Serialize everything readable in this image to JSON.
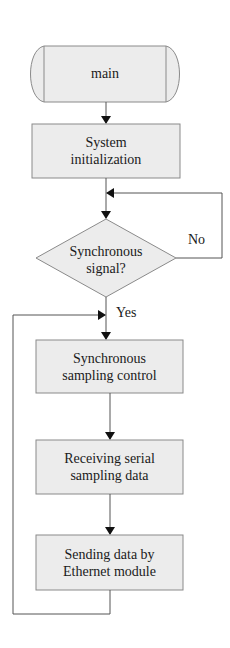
{
  "diagram": {
    "type": "flowchart",
    "colors": {
      "box_fill": "#ececec",
      "box_stroke": "#8a8a8a",
      "line": "#555555",
      "arrow": "#111111"
    },
    "nodes": [
      {
        "id": "main",
        "shape": "terminator",
        "label": "main"
      },
      {
        "id": "init",
        "shape": "process",
        "line1": "System",
        "line2": "initialization"
      },
      {
        "id": "sync_check",
        "shape": "decision",
        "line1": "Synchronous",
        "line2": "signal?"
      },
      {
        "id": "sync_ctrl",
        "shape": "process",
        "line1": "Synchronous",
        "line2": "sampling control"
      },
      {
        "id": "recv",
        "shape": "process",
        "line1": "Receiving serial",
        "line2": "sampling data"
      },
      {
        "id": "send",
        "shape": "process",
        "line1": "Sending data by",
        "line2": "Ethernet module"
      }
    ],
    "edges": [
      {
        "from": "main",
        "to": "init",
        "label": ""
      },
      {
        "from": "init",
        "to": "sync_check",
        "label": ""
      },
      {
        "from": "sync_check",
        "to": "sync_check",
        "label": "No"
      },
      {
        "from": "sync_check",
        "to": "sync_ctrl",
        "label": "Yes"
      },
      {
        "from": "sync_ctrl",
        "to": "recv",
        "label": ""
      },
      {
        "from": "recv",
        "to": "send",
        "label": ""
      },
      {
        "from": "send",
        "to": "sync_ctrl",
        "label": ""
      }
    ],
    "edge_labels": {
      "no": "No",
      "yes": "Yes"
    }
  }
}
